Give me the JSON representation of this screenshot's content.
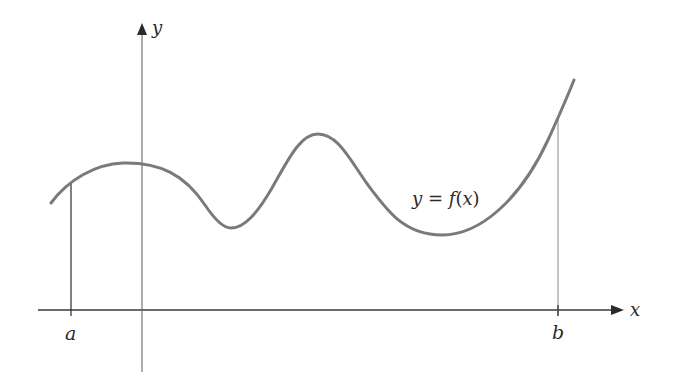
{
  "figure": {
    "x_axis_label": "x",
    "y_axis_label": "y",
    "curve_label": "y = f(x)",
    "curve_label_parts": {
      "lhs": "y",
      "eq": " = ",
      "fn": "f",
      "open": "(",
      "arg": "x",
      "close": ")"
    },
    "left_bound_label": "a",
    "right_bound_label": "b",
    "colors": {
      "axis": "#3a3a3a",
      "curve": "#7a7a7a",
      "bound_line_a": "#2a2a2a",
      "bound_line_b": "#8a8a8a",
      "text": "#2a2a2a",
      "background": "#ffffff"
    }
  }
}
